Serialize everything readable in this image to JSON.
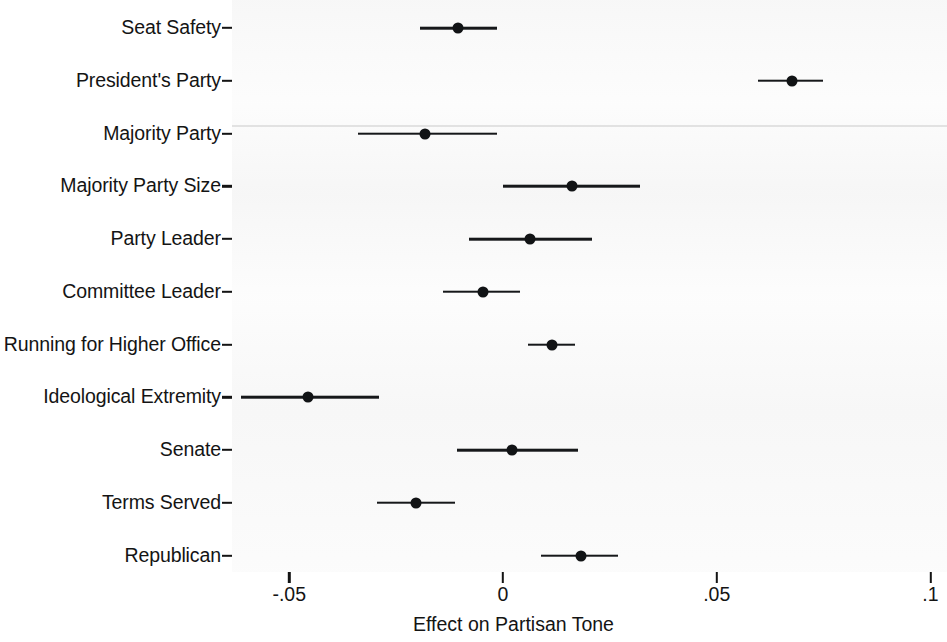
{
  "chart_data": {
    "type": "scatter",
    "subtype": "coefficient-plot-with-confidence-intervals",
    "title": "",
    "xlabel": "Effect on Partisan Tone",
    "ylabel": "",
    "xlim": [
      -0.0619,
      0.1039
    ],
    "xticks": [
      -0.05,
      0,
      0.05,
      0.1
    ],
    "xticklabels": [
      "-.05",
      "0",
      ".05",
      ".1"
    ],
    "grid": false,
    "legend": null,
    "categories": [
      "Seat Safety",
      "President's Party",
      "Majority Party",
      "Majority Party Size",
      "Party Leader",
      "Committee Leader",
      "Running for Higher Office",
      "Ideological Extremity",
      "Senate",
      "Terms Served",
      "Republican"
    ],
    "values": [
      -0.0105,
      0.0676,
      -0.0182,
      0.0161,
      0.0063,
      -0.0047,
      0.0115,
      -0.0456,
      0.0021,
      -0.0203,
      0.0182
    ],
    "ci_low": [
      -0.0194,
      0.0596,
      -0.0339,
      0.0,
      -0.008,
      -0.014,
      0.0058,
      -0.0613,
      -0.0108,
      -0.0295,
      0.0089
    ],
    "ci_high": [
      -0.0014,
      0.0749,
      -0.0014,
      0.032,
      0.0208,
      0.004,
      0.0168,
      -0.029,
      0.0175,
      -0.0112,
      0.0269
    ],
    "points": [
      {
        "label": "Seat Safety",
        "estimate": -0.0105,
        "ci_low": -0.0194,
        "ci_high": -0.0014
      },
      {
        "label": "President's Party",
        "estimate": 0.0676,
        "ci_low": 0.0596,
        "ci_high": 0.0749
      },
      {
        "label": "Majority Party",
        "estimate": -0.0182,
        "ci_low": -0.0339,
        "ci_high": -0.0014
      },
      {
        "label": "Majority Party Size",
        "estimate": 0.0161,
        "ci_low": 0.0,
        "ci_high": 0.032
      },
      {
        "label": "Party Leader",
        "estimate": 0.0063,
        "ci_low": -0.008,
        "ci_high": 0.0208
      },
      {
        "label": "Committee Leader",
        "estimate": -0.0047,
        "ci_low": -0.014,
        "ci_high": 0.004
      },
      {
        "label": "Running for Higher Office",
        "estimate": 0.0115,
        "ci_low": 0.0058,
        "ci_high": 0.0168
      },
      {
        "label": "Ideological Extremity",
        "estimate": -0.0456,
        "ci_low": -0.0613,
        "ci_high": -0.029
      },
      {
        "label": "Senate",
        "estimate": 0.0021,
        "ci_low": -0.0108,
        "ci_high": 0.0175
      },
      {
        "label": "Terms Served",
        "estimate": -0.0203,
        "ci_low": -0.0295,
        "ci_high": -0.0112
      },
      {
        "label": "Republican",
        "estimate": 0.0182,
        "ci_low": 0.0089,
        "ci_high": 0.0269
      }
    ]
  }
}
